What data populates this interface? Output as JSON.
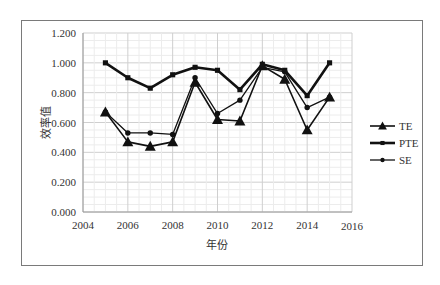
{
  "chart_data": {
    "type": "line",
    "title": "",
    "xlabel": "年份",
    "ylabel": "效率值",
    "xlim": [
      2004,
      2016
    ],
    "ylim": [
      0,
      1.2
    ],
    "x_ticks": [
      "2004",
      "2006",
      "2008",
      "2010",
      "2012",
      "2014",
      "2016"
    ],
    "y_ticks": [
      "0.000",
      "0.200",
      "0.400",
      "0.600",
      "0.800",
      "1.000",
      "1.200"
    ],
    "grid": true,
    "legend_position": "right",
    "x": [
      2005,
      2006,
      2007,
      2008,
      2009,
      2010,
      2011,
      2012,
      2013,
      2014,
      2015
    ],
    "series": [
      {
        "name": "TE",
        "marker": "triangle",
        "values": [
          0.67,
          0.47,
          0.44,
          0.47,
          0.87,
          0.62,
          0.61,
          0.98,
          0.89,
          0.55,
          0.77
        ]
      },
      {
        "name": "PTE",
        "marker": "square",
        "values": [
          1.0,
          0.9,
          0.83,
          0.92,
          0.97,
          0.95,
          0.82,
          0.99,
          0.95,
          0.78,
          1.0
        ]
      },
      {
        "name": "SE",
        "marker": "circle",
        "values": [
          0.67,
          0.53,
          0.53,
          0.52,
          0.9,
          0.66,
          0.75,
          0.97,
          0.94,
          0.7,
          0.77
        ]
      }
    ]
  },
  "colors": {
    "line": "#111111",
    "grid_major": "#cfcfcf",
    "grid_minor": "#ececec",
    "frame": "#7a7a7a"
  }
}
